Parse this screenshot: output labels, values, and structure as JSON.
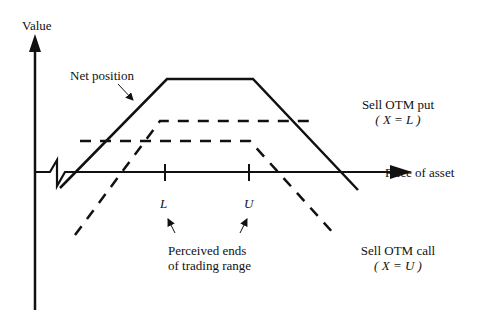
{
  "diagram": {
    "type": "options-payoff",
    "axes": {
      "y_label": "Value",
      "x_label": "Price of asset"
    },
    "lines": [
      {
        "name": "Net position",
        "style": "solid",
        "points": [
          [
            60,
            188
          ],
          [
            167,
            79
          ],
          [
            253,
            79
          ],
          [
            358,
            190
          ]
        ]
      },
      {
        "name": "Sell OTM put",
        "style": "dashed",
        "points": [
          [
            75,
            235
          ],
          [
            160,
            121
          ],
          [
            310,
            121
          ]
        ]
      },
      {
        "name": "Sell OTM call",
        "style": "dashed",
        "points": [
          [
            80,
            141
          ],
          [
            250,
            141
          ],
          [
            335,
            235
          ]
        ]
      }
    ],
    "ticks": [
      {
        "label": "L",
        "x": 165
      },
      {
        "label": "U",
        "x": 249
      }
    ],
    "labels": {
      "net_position": "Net position",
      "sell_put_line1": "Sell OTM put",
      "sell_put_line2": "( X = L )",
      "sell_call_line1": "Sell OTM call",
      "sell_call_line2": "( X = U )",
      "tick_L": "L",
      "tick_U": "U",
      "range_line1": "Perceived ends",
      "range_line2": "of trading range"
    },
    "colors": {
      "line": "#111111",
      "background": "#ffffff"
    }
  }
}
